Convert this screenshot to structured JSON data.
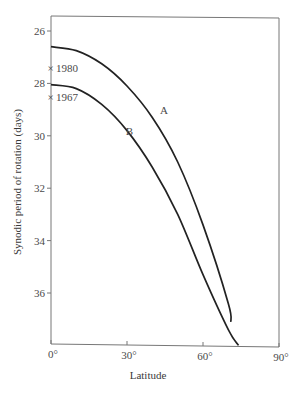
{
  "chart_data": {
    "type": "line",
    "title": "",
    "xlabel": "Latitude",
    "ylabel": "Synodic period of rotation (days)",
    "xlim": [
      0,
      90
    ],
    "ylim": [
      38,
      25.6
    ],
    "y_inverted": true,
    "grid": false,
    "x_ticks": [
      "0°",
      "30°",
      "60°",
      "90°"
    ],
    "x_tick_values": [
      0,
      30,
      60,
      90
    ],
    "y_ticks": [
      "26",
      "28",
      "30",
      "32",
      "34",
      "36"
    ],
    "y_tick_values": [
      26,
      28,
      30,
      32,
      34,
      36
    ],
    "series": [
      {
        "name": "A",
        "x": [
          0,
          10,
          20,
          30,
          40,
          50,
          60,
          70,
          71
        ],
        "y": [
          26.6,
          26.75,
          27.25,
          28.1,
          29.3,
          31.0,
          33.4,
          36.4,
          37.1
        ]
      },
      {
        "name": "B",
        "x": [
          0,
          10,
          20,
          30,
          40,
          50,
          60,
          70,
          74
        ],
        "y": [
          28.05,
          28.2,
          28.8,
          29.8,
          31.2,
          33.0,
          35.3,
          37.4,
          38.0
        ]
      }
    ],
    "annotations": [
      {
        "text": "1980",
        "x": 0,
        "y": 27.4,
        "marker": "x"
      },
      {
        "text": "1967",
        "x": 0,
        "y": 28.5,
        "marker": "x"
      },
      {
        "text": "A",
        "x": 43,
        "y": 29.0
      },
      {
        "text": "B",
        "x": 29.5,
        "y": 29.8
      }
    ]
  }
}
